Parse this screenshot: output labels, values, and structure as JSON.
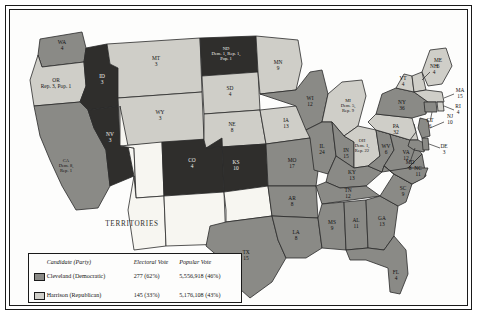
{
  "map": {
    "title": "Presidential Election of 1892",
    "territories_label": "TERRITORIES",
    "colors": {
      "democratic": "#8a8a86",
      "republican": "#cfcec8",
      "populist": "#2f2e2c",
      "territory": "#f7f6f1",
      "water": "#ffffff",
      "border": "#2a2a2a",
      "ink": "#111111"
    }
  },
  "legend": {
    "headers": {
      "candidate": "Candidate (Party)",
      "electoral": "Electoral Vote",
      "popular": "Popular Vote"
    },
    "rows": [
      {
        "swatch": "democratic",
        "candidate": "Cleveland (Democratic)",
        "electoral": "277 (62%)",
        "popular": "5,556,918 (46%)"
      },
      {
        "swatch": "republican",
        "candidate": "Harrison (Republican)",
        "electoral": "145 (33%)",
        "popular": "5,176,108 (43%)"
      },
      {
        "swatch": "populist",
        "candidate": "Weaver (Populist)",
        "electoral": "22 (5%)",
        "popular": "1,041,028 (9%)"
      }
    ]
  },
  "states": [
    {
      "id": "WA",
      "label": "WA",
      "votes": "4",
      "party": "democratic"
    },
    {
      "id": "OR",
      "label": "OR",
      "split": "Rep. 3, Pop. 1",
      "party": "republican"
    },
    {
      "id": "CA",
      "label": "CA",
      "split": "Dem. 8,\nRep. 1",
      "party": "democratic"
    },
    {
      "id": "NV",
      "label": "NV",
      "votes": "3",
      "party": "populist"
    },
    {
      "id": "ID",
      "label": "ID",
      "votes": "3",
      "party": "populist"
    },
    {
      "id": "MT",
      "label": "MT",
      "votes": "3",
      "party": "republican"
    },
    {
      "id": "WY",
      "label": "WY",
      "votes": "3",
      "party": "republican"
    },
    {
      "id": "UT",
      "label": "UT",
      "votes": "",
      "party": "territory"
    },
    {
      "id": "CO",
      "label": "CO",
      "votes": "4",
      "party": "populist"
    },
    {
      "id": "AZ",
      "label": "",
      "votes": "",
      "party": "territory"
    },
    {
      "id": "NM",
      "label": "",
      "votes": "",
      "party": "territory"
    },
    {
      "id": "ND",
      "label": "ND",
      "split": "Dem. 1, Rep. 1,\nPop. 1",
      "party": "populist"
    },
    {
      "id": "SD",
      "label": "SD",
      "votes": "4",
      "party": "republican"
    },
    {
      "id": "NE",
      "label": "NE",
      "votes": "8",
      "party": "republican"
    },
    {
      "id": "KS",
      "label": "KS",
      "votes": "10",
      "party": "populist"
    },
    {
      "id": "OK",
      "label": "",
      "votes": "",
      "party": "territory"
    },
    {
      "id": "TX",
      "label": "TX",
      "votes": "15",
      "party": "democratic"
    },
    {
      "id": "MN",
      "label": "MN",
      "votes": "9",
      "party": "republican"
    },
    {
      "id": "IA",
      "label": "IA",
      "votes": "13",
      "party": "republican"
    },
    {
      "id": "MO",
      "label": "MO",
      "votes": "17",
      "party": "democratic"
    },
    {
      "id": "AR",
      "label": "AR",
      "votes": "8",
      "party": "democratic"
    },
    {
      "id": "LA",
      "label": "LA",
      "votes": "8",
      "party": "democratic"
    },
    {
      "id": "WI",
      "label": "WI",
      "votes": "12",
      "party": "democratic"
    },
    {
      "id": "IL",
      "label": "IL",
      "votes": "24",
      "party": "democratic"
    },
    {
      "id": "MI",
      "label": "MI",
      "split": "Dem. 5,\nRep. 9",
      "party": "republican"
    },
    {
      "id": "IN",
      "label": "IN",
      "votes": "15",
      "party": "democratic"
    },
    {
      "id": "OH",
      "label": "OH",
      "split": "Dem. 1,\nRep. 22",
      "party": "republican"
    },
    {
      "id": "KY",
      "label": "KY",
      "votes": "13",
      "party": "democratic"
    },
    {
      "id": "TN",
      "label": "TN",
      "votes": "12",
      "party": "democratic"
    },
    {
      "id": "MS",
      "label": "MS",
      "votes": "9",
      "party": "democratic"
    },
    {
      "id": "AL",
      "label": "AL",
      "votes": "11",
      "party": "democratic"
    },
    {
      "id": "GA",
      "label": "GA",
      "votes": "13",
      "party": "democratic"
    },
    {
      "id": "FL",
      "label": "FL",
      "votes": "4",
      "party": "democratic"
    },
    {
      "id": "SC",
      "label": "SC",
      "votes": "9",
      "party": "democratic"
    },
    {
      "id": "NC",
      "label": "NC",
      "votes": "11",
      "party": "democratic"
    },
    {
      "id": "VA",
      "label": "VA",
      "votes": "12",
      "party": "democratic"
    },
    {
      "id": "WV",
      "label": "WV",
      "votes": "6",
      "party": "democratic"
    },
    {
      "id": "MD",
      "label": "MD",
      "votes": "8",
      "party": "democratic"
    },
    {
      "id": "DE",
      "label": "DE",
      "votes": "3",
      "party": "democratic"
    },
    {
      "id": "PA",
      "label": "PA",
      "votes": "32",
      "party": "republican"
    },
    {
      "id": "NJ",
      "label": "NJ",
      "votes": "10",
      "party": "democratic"
    },
    {
      "id": "NY",
      "label": "NY",
      "votes": "36",
      "party": "democratic"
    },
    {
      "id": "CT",
      "label": "CT",
      "votes": "6",
      "party": "democratic"
    },
    {
      "id": "RI",
      "label": "RI",
      "votes": "4",
      "party": "republican"
    },
    {
      "id": "MA",
      "label": "MA",
      "votes": "15",
      "party": "republican"
    },
    {
      "id": "VT",
      "label": "VT",
      "votes": "4",
      "party": "republican"
    },
    {
      "id": "NH",
      "label": "NH",
      "votes": "4",
      "party": "republican"
    },
    {
      "id": "ME",
      "label": "ME",
      "votes": "6",
      "party": "republican"
    }
  ]
}
